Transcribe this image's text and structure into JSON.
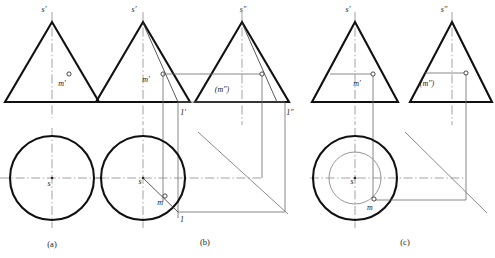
{
  "figure": {
    "canvas": {
      "width": 495,
      "height": 258,
      "background": "#ffffff"
    },
    "colors": {
      "outline": "#111111",
      "thin_line": "#6a6a6a",
      "center_line": "#8c8c8c",
      "miter_line": "#7d7d7d",
      "label_text": "#1a1a1a",
      "point_fill": "#ffffff"
    },
    "captions": [
      {
        "key": "a",
        "text": "(a)",
        "x": 52,
        "y": 247
      },
      {
        "key": "b",
        "text": "(b)",
        "x": 205,
        "y": 245
      },
      {
        "key": "c",
        "text": "(c)",
        "x": 405,
        "y": 245
      }
    ],
    "panels": [
      {
        "key": "a",
        "caption": "(a)",
        "views": [
          {
            "name": "front-view",
            "shape": "triangle",
            "labels": [
              {
                "text": "s'",
                "x": 44,
                "y": 12
              },
              {
                "text": "m'",
                "x": 62,
                "y": 86
              }
            ],
            "points": [
              {
                "name": "m-prime",
                "x": 69,
                "y": 74,
                "style": "open"
              }
            ]
          },
          {
            "name": "top-view",
            "shape": "circle",
            "labels": [
              {
                "text": "s",
                "x": 49,
                "y": 186
              }
            ],
            "points": [
              {
                "name": "s-center",
                "x": 52,
                "y": 178,
                "style": "dot"
              }
            ]
          }
        ]
      },
      {
        "key": "b",
        "caption": "(b)",
        "views": [
          {
            "name": "front-view",
            "shape": "triangle",
            "labels": [
              {
                "text": "s'",
                "x": 134,
                "y": 12
              },
              {
                "text": "m'",
                "x": 146,
                "y": 82
              },
              {
                "text": "1'",
                "x": 183,
                "y": 115
              }
            ],
            "points": [
              {
                "name": "m-prime",
                "x": 163,
                "y": 74,
                "style": "open"
              }
            ]
          },
          {
            "name": "side-view",
            "shape": "triangle",
            "labels": [
              {
                "text": "s''",
                "x": 243,
                "y": 12
              },
              {
                "text": "(m'')",
                "x": 222,
                "y": 92
              },
              {
                "text": "1''",
                "x": 290,
                "y": 115
              }
            ],
            "points": [
              {
                "name": "m-double-prime",
                "x": 262,
                "y": 74,
                "style": "open"
              }
            ]
          },
          {
            "name": "top-view",
            "shape": "circle",
            "labels": [
              {
                "text": "s",
                "x": 140,
                "y": 184
              },
              {
                "text": "m",
                "x": 163,
                "y": 203
              },
              {
                "text": "1",
                "x": 182,
                "y": 221
              }
            ],
            "points": [
              {
                "name": "s-center",
                "x": 143,
                "y": 178,
                "style": "dot"
              },
              {
                "name": "m-top",
                "x": 165,
                "y": 196,
                "style": "open"
              }
            ]
          },
          {
            "name": "miter-line",
            "shape": "45-degree-line"
          }
        ]
      },
      {
        "key": "c",
        "caption": "(c)",
        "views": [
          {
            "name": "front-view",
            "shape": "triangle",
            "labels": [
              {
                "text": "s'",
                "x": 348,
                "y": 12
              },
              {
                "text": "m'",
                "x": 355,
                "y": 86
              }
            ],
            "points": [
              {
                "name": "m-prime",
                "x": 373,
                "y": 74,
                "style": "open"
              }
            ]
          },
          {
            "name": "side-view",
            "shape": "triangle",
            "labels": [
              {
                "text": "s''",
                "x": 444,
                "y": 12
              },
              {
                "text": "(m'')",
                "x": 425,
                "y": 86
              }
            ],
            "points": [
              {
                "name": "m-double-prime",
                "x": 452,
                "y": 73,
                "style": "open"
              }
            ]
          },
          {
            "name": "top-view",
            "shape": "concentric-circles",
            "labels": [
              {
                "text": "s",
                "x": 352,
                "y": 184
              },
              {
                "text": "m",
                "x": 370,
                "y": 208
              }
            ],
            "points": [
              {
                "name": "s-center",
                "x": 355,
                "y": 178,
                "style": "dot"
              },
              {
                "name": "m-top",
                "x": 374,
                "y": 199,
                "style": "open"
              }
            ]
          },
          {
            "name": "miter-line",
            "shape": "45-degree-line"
          }
        ]
      }
    ]
  }
}
